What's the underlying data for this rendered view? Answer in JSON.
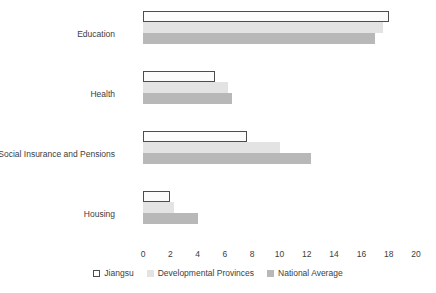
{
  "chart_data": {
    "type": "bar",
    "orientation": "horizontal",
    "title": "",
    "xlabel": "",
    "ylabel": "",
    "xlim": [
      0,
      20
    ],
    "xticks": [
      0,
      2,
      4,
      6,
      8,
      10,
      12,
      14,
      16,
      18,
      20
    ],
    "grid": false,
    "legend_position": "bottom",
    "categories": [
      "Education",
      "Health",
      "Social Insurance and Pensions",
      "Housing"
    ],
    "series": [
      {
        "name": "Jiangsu",
        "color": "#ffffff",
        "edgecolor": "#4d4d4d",
        "values": [
          18.0,
          5.3,
          7.6,
          2.0
        ]
      },
      {
        "name": "Developmental Provinces",
        "color": "#e3e3e3",
        "values": [
          17.6,
          6.2,
          10.0,
          2.3
        ]
      },
      {
        "name": "National Average",
        "color": "#b8b8b8",
        "values": [
          17.0,
          6.5,
          12.3,
          4.0
        ]
      }
    ]
  },
  "legend": {
    "items": [
      {
        "label": "Jiangsu"
      },
      {
        "label": "Developmental Provinces"
      },
      {
        "label": "National Average"
      }
    ]
  }
}
